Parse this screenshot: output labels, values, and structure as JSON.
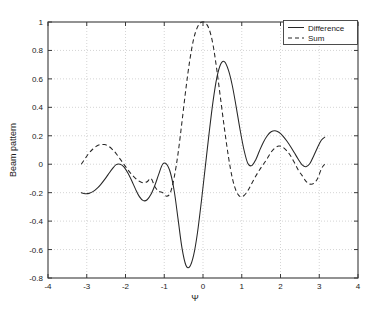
{
  "chart_data": {
    "type": "line",
    "title": "",
    "xlabel": "Ψ",
    "ylabel": "Beam pattern",
    "xlim": [
      -4,
      4
    ],
    "ylim": [
      -0.8,
      1
    ],
    "xticks": [
      -4,
      -3,
      -2,
      -1,
      0,
      1,
      2,
      3,
      4
    ],
    "xtick_labels": [
      "-4",
      "-3",
      "-2",
      "-1",
      "0",
      "1",
      "2",
      "3",
      "4"
    ],
    "yticks": [
      -0.8,
      -0.6,
      -0.4,
      -0.2,
      0,
      0.2,
      0.4,
      0.6,
      0.8,
      1
    ],
    "ytick_labels": [
      "-0.8",
      "-0.6",
      "-0.4",
      "-0.2",
      "0",
      "0.2",
      "0.4",
      "0.6",
      "0.8",
      "1"
    ],
    "grid": true,
    "grid_style": "dotted",
    "legend_position": "top-right",
    "series": [
      {
        "name": "Difference",
        "style": "solid",
        "color": "#262626",
        "x": [
          -3.1416,
          -3.0416,
          -2.9416,
          -2.8416,
          -2.7416,
          -2.6416,
          -2.5416,
          -2.4416,
          -2.3416,
          -2.2416,
          -2.1416,
          -2.0416,
          -1.9416,
          -1.8416,
          -1.7416,
          -1.6416,
          -1.5416,
          -1.4416,
          -1.3416,
          -1.2416,
          -1.1416,
          -1.0416,
          -0.9416,
          -0.8416,
          -0.7416,
          -0.6416,
          -0.5416,
          -0.4416,
          -0.3416,
          -0.2416,
          -0.1416,
          -0.0416,
          0.0584,
          0.1584,
          0.2584,
          0.3584,
          0.4584,
          0.5584,
          0.6584,
          0.7584,
          0.8584,
          0.9584,
          1.0584,
          1.1584,
          1.2584,
          1.3584,
          1.4584,
          1.5584,
          1.6584,
          1.7584,
          1.8584,
          1.9584,
          2.0584,
          2.1584,
          2.2584,
          2.3584,
          2.4584,
          2.5584,
          2.6584,
          2.7584,
          2.8584,
          2.9584,
          3.0584,
          3.1416
        ],
        "y": [
          -0.2,
          -0.207,
          -0.205,
          -0.193,
          -0.172,
          -0.143,
          -0.108,
          -0.07,
          -0.033,
          -0.003,
          0.0,
          -0.018,
          -0.06,
          -0.115,
          -0.175,
          -0.228,
          -0.256,
          -0.25,
          -0.212,
          -0.148,
          -0.07,
          0.0,
          0.0,
          -0.06,
          -0.19,
          -0.39,
          -0.59,
          -0.71,
          -0.72,
          -0.64,
          -0.48,
          -0.26,
          -0.02,
          0.22,
          0.44,
          0.61,
          0.705,
          0.72,
          0.66,
          0.55,
          0.4,
          0.24,
          0.1,
          0.005,
          -0.01,
          0.03,
          0.095,
          0.155,
          0.2,
          0.228,
          0.235,
          0.225,
          0.2,
          0.165,
          0.125,
          0.08,
          0.035,
          -0.005,
          -0.018,
          0.005,
          0.06,
          0.12,
          0.17,
          0.19
        ]
      },
      {
        "name": "Sum",
        "style": "dashed",
        "color": "#262626",
        "x": [
          -3.1416,
          -3.0416,
          -2.9416,
          -2.8416,
          -2.7416,
          -2.6416,
          -2.5416,
          -2.4416,
          -2.3416,
          -2.2416,
          -2.1416,
          -2.0416,
          -1.9416,
          -1.8416,
          -1.7416,
          -1.6416,
          -1.5416,
          -1.4416,
          -1.3416,
          -1.2416,
          -1.1416,
          -1.0416,
          -0.9416,
          -0.8416,
          -0.7416,
          -0.6416,
          -0.5416,
          -0.4416,
          -0.3416,
          -0.2416,
          -0.1416,
          -0.0416,
          0.0584,
          0.1584,
          0.2584,
          0.3584,
          0.4584,
          0.5584,
          0.6584,
          0.7584,
          0.8584,
          0.9584,
          1.0584,
          1.1584,
          1.2584,
          1.3584,
          1.4584,
          1.5584,
          1.6584,
          1.7584,
          1.8584,
          1.9584,
          2.0584,
          2.1584,
          2.2584,
          2.3584,
          2.4584,
          2.5584,
          2.6584,
          2.7584,
          2.8584,
          2.9584,
          3.0584,
          3.1416
        ],
        "y": [
          0.0,
          0.04,
          0.078,
          0.107,
          0.128,
          0.138,
          0.138,
          0.127,
          0.105,
          0.075,
          0.038,
          0.0,
          -0.038,
          -0.072,
          -0.099,
          -0.12,
          -0.13,
          -0.123,
          -0.1,
          -0.158,
          -0.19,
          -0.2,
          -0.225,
          -0.2,
          -0.09,
          0.08,
          0.3,
          0.53,
          0.73,
          0.88,
          0.965,
          0.998,
          0.995,
          0.95,
          0.84,
          0.66,
          0.45,
          0.24,
          0.05,
          -0.1,
          -0.19,
          -0.228,
          -0.22,
          -0.185,
          -0.135,
          -0.085,
          -0.04,
          0.0,
          0.04,
          0.085,
          0.115,
          0.128,
          0.12,
          0.095,
          0.06,
          0.012,
          -0.04,
          -0.08,
          -0.12,
          -0.14,
          -0.135,
          -0.1,
          -0.03,
          0.0
        ]
      }
    ]
  },
  "legend": {
    "items": [
      {
        "label": "Difference",
        "style": "solid"
      },
      {
        "label": "Sum",
        "style": "dashed"
      }
    ]
  },
  "axes": {
    "ylabel": "Beam pattern",
    "xlabel": "Ψ"
  }
}
